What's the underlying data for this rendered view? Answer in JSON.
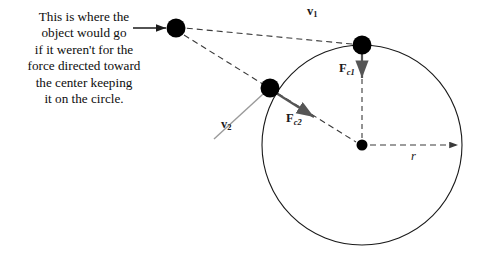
{
  "figure": {
    "caption": {
      "lines": [
        "This is where the",
        "object would go",
        "if it weren't for the",
        "force directed toward",
        "the center keeping",
        "it on the circle."
      ]
    },
    "labels": {
      "v1": {
        "symbol": "v",
        "subscript": "1"
      },
      "v2": {
        "symbol": "v",
        "subscript": "2"
      },
      "fc1": {
        "symbol": "F",
        "subscript": "c1"
      },
      "fc2": {
        "symbol": "F",
        "subscript": "c2"
      },
      "radius": {
        "symbol": "r"
      }
    },
    "colors": {
      "stroke": "#1a1a1a",
      "dashed": "#3a3a3a",
      "tangent": "#9a9a9a",
      "force": "#555555",
      "ball": "#000000",
      "background": "#ffffff"
    },
    "geometry": {
      "circle_center": [
        362,
        145
      ],
      "circle_radius": 100,
      "ball_tangent_point": [
        362,
        45
      ],
      "ball_circle_point": [
        270,
        88
      ],
      "ball_projected_point": [
        176,
        28
      ],
      "center_dot": [
        362,
        145
      ]
    }
  }
}
